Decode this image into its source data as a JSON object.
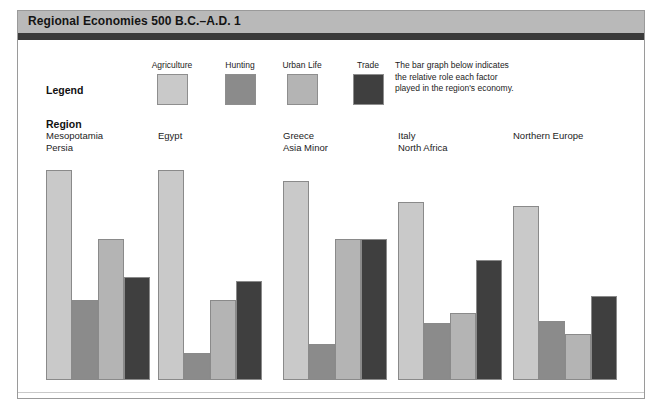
{
  "title": "Regional Economies 500 B.C.–A.D. 1",
  "legend": {
    "label": "Legend",
    "items": [
      {
        "name": "Agriculture",
        "color": "#c9c9c9"
      },
      {
        "name": "Hunting",
        "color": "#8b8b8b"
      },
      {
        "name": "Urban Life",
        "color": "#b4b4b4"
      },
      {
        "name": "Trade",
        "color": "#3f3f3f"
      }
    ]
  },
  "caption": {
    "line1": "The bar graph below indicates",
    "line2": "the relative role each factor",
    "line3": "played in the region's economy."
  },
  "region_heading": "Region",
  "chart_data": {
    "type": "bar",
    "title": "Regional Economies 500 B.C.–A.D. 1",
    "xlabel": "Region",
    "ylabel": "Relative role in economy",
    "ylim": [
      0,
      100
    ],
    "grid": false,
    "legend_position": "top",
    "note": "The bar graph below indicates the relative role each factor played in the region's economy.",
    "categories": [
      "Mesopotamia Persia",
      "Egypt",
      "Greece Asia Minor",
      "Italy North Africa",
      "Northern Europe"
    ],
    "category_lines": [
      [
        "Mesopotamia",
        "Persia"
      ],
      [
        "Egypt",
        ""
      ],
      [
        "Greece",
        "Asia Minor"
      ],
      [
        "Italy",
        "North Africa"
      ],
      [
        "Northern Europe",
        ""
      ]
    ],
    "series": [
      {
        "name": "Agriculture",
        "color": "#c9c9c9",
        "values": [
          100,
          100,
          95,
          85,
          83
        ]
      },
      {
        "name": "Hunting",
        "color": "#8b8b8b",
        "values": [
          38,
          13,
          17,
          27,
          28
        ]
      },
      {
        "name": "Urban Life",
        "color": "#b4b4b4",
        "values": [
          67,
          38,
          67,
          32,
          22
        ]
      },
      {
        "name": "Trade",
        "color": "#3f3f3f",
        "values": [
          49,
          47,
          67,
          57,
          40
        ]
      }
    ]
  }
}
